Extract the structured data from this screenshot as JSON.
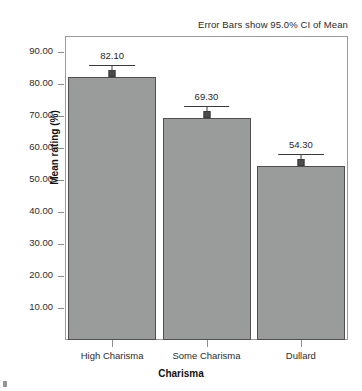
{
  "chart_data": {
    "type": "bar",
    "title": "",
    "annotation": "Error Bars show 95.0% CI of Mean",
    "xlabel": "Charisma",
    "ylabel": "Mean rating (%)",
    "categories": [
      "High Charisma",
      "Some Charisma",
      "Dullard"
    ],
    "values": [
      82.1,
      69.3,
      54.3
    ],
    "data_labels": [
      "82.10",
      "69.30",
      "54.30"
    ],
    "error_bars": {
      "type": "95% CI of Mean",
      "ci_upper": [
        86.0,
        73.2,
        58.2
      ],
      "ci_lower": [
        78.2,
        65.4,
        50.4
      ]
    },
    "ylim": [
      0,
      95
    ],
    "yticks": [
      10,
      20,
      30,
      40,
      50,
      60,
      70,
      80,
      90
    ],
    "ytick_labels": [
      "10.00",
      "20.00",
      "30.00",
      "40.00",
      "50.00",
      "60.00",
      "70.00",
      "80.00",
      "90.00"
    ],
    "grid": false,
    "legend": "none",
    "bar_color": "#9a9b9b",
    "bar_edge_color": "#4f4f4f",
    "error_bar_color": "#3a3a3a"
  }
}
